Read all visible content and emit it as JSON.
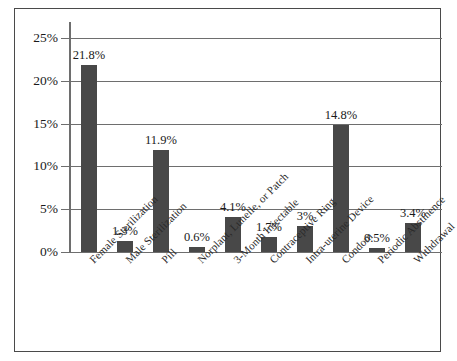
{
  "figure": {
    "background_color": "#ffffff",
    "frame_color": "#4a4a4a",
    "bar_color": "#484848",
    "gridline_color": "#6e6e6e",
    "text_color": "#1a1a1a"
  },
  "chart_data": {
    "type": "bar",
    "title": "",
    "subtitle": "",
    "xlabel": "",
    "ylabel": "",
    "ylim": [
      0,
      25
    ],
    "grid": true,
    "legend": false,
    "orientation": "vertical",
    "y_tick_labels": [
      "0%",
      "5%",
      "10%",
      "15%",
      "20%",
      "25%"
    ],
    "y_ticks": [
      0,
      5,
      10,
      15,
      20,
      25
    ],
    "categories": [
      "Female Sterilization",
      "Male Sterilization",
      "Pill",
      "Norplant, Lunelle, or Patch",
      "3-Month Injectable",
      "Contraceptive Ring",
      "Intra-uterine Device",
      "Condom",
      "Periodic Abstinence",
      "Withdrawal"
    ],
    "values": [
      21.8,
      1.3,
      11.9,
      0.6,
      4.1,
      1.7,
      3,
      14.8,
      0.5,
      3.4
    ],
    "data_labels": [
      "21.8%",
      "1.3%",
      "11.9%",
      "0.6%",
      "4.1%",
      "1.7%",
      "3%",
      "14.8%",
      "0.5%",
      "3.4%"
    ]
  }
}
